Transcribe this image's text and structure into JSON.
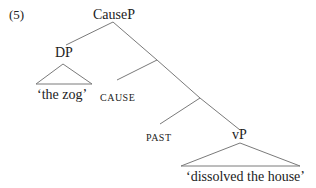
{
  "example_number": "(5)",
  "nodes": {
    "root": "CauseP",
    "dp": "DP",
    "dp_content": "‘the zog’",
    "cause": "CAUSE",
    "past": "PAST",
    "vp": "vP",
    "vp_content": "‘dissolved the house’"
  },
  "colors": {
    "line": "#7a7a7a",
    "text": "#222222"
  }
}
